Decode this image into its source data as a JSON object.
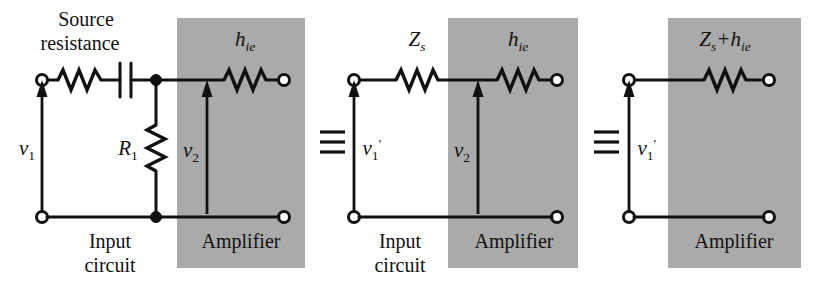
{
  "figure": {
    "background_color": "#ffffff",
    "line_color": "#111111",
    "shade_color": "#aaaaaa"
  },
  "labels": {
    "source_resistance_line1": "Source",
    "source_resistance_line2": "resistance",
    "r1": "R",
    "r1_sub": "1",
    "hie": "h",
    "hie_sub": "ie",
    "v1": "v",
    "v1_sub": "1",
    "v2": "v",
    "v2_sub": "2",
    "v1prime": "v",
    "v1prime_sub": "1",
    "v1prime_mark": "′",
    "zs": "Z",
    "zs_sub": "s",
    "zs_plus_hie_z": "Z",
    "zs_plus_hie_zsub": "s",
    "zs_plus_hie_plus": "+",
    "zs_plus_hie_h": "h",
    "zs_plus_hie_hsub": "ie",
    "input_circuit_line1": "Input",
    "input_circuit_line2": "circuit",
    "amplifier": "Amplifier",
    "equivalence": "≡"
  },
  "circuits": [
    {
      "name": "circuit-full",
      "description": "Source resistance with coupling capacitor, bias resistor R1, feeding amplifier input hie",
      "elements": [
        "input-terminal-pair",
        "series-resistor",
        "series-capacitor",
        "shunt-resistor-R1",
        "amplifier-resistor-hie",
        "output-terminal-pair"
      ],
      "voltages": [
        "v1",
        "v2"
      ],
      "regions": [
        "input circuit",
        "amplifier"
      ]
    },
    {
      "name": "circuit-thevenin",
      "description": "Thevenin equivalent source impedance Zs feeding amplifier input hie",
      "elements": [
        "input-terminal-pair",
        "series-resistor-Zs",
        "amplifier-resistor-hie",
        "output-terminal-pair"
      ],
      "voltages": [
        "v1prime",
        "v2"
      ],
      "regions": [
        "input circuit",
        "amplifier"
      ]
    },
    {
      "name": "circuit-combined",
      "description": "Single combined series impedance Zs + hie inside amplifier block",
      "elements": [
        "input-terminal-pair",
        "series-resistor-Zs-plus-hie",
        "output-terminal-pair"
      ],
      "voltages": [
        "v1prime"
      ],
      "regions": [
        "amplifier"
      ]
    }
  ]
}
